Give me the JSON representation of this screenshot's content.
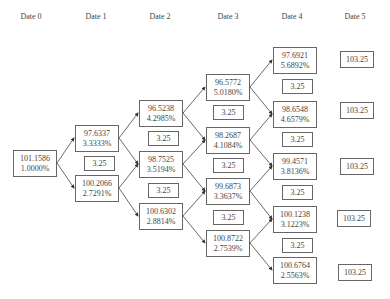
{
  "headers": [
    "Date 0",
    "Date 1",
    "Date 2",
    "Date 3",
    "Date 4",
    "Date 5"
  ],
  "coupon_label": "3.25",
  "nodes": {
    "d0": [
      {
        "price": "101.1586",
        "rate": "1.0000%"
      }
    ],
    "d1": [
      {
        "price": "97.6337",
        "rate": "3.3333%"
      },
      {
        "price": "100.2066",
        "rate": "2.7291%"
      }
    ],
    "d2": [
      {
        "price": "96.5238",
        "rate": "4.2985%"
      },
      {
        "price": "98.7525",
        "rate": "3.5194%"
      },
      {
        "price": "100.6302",
        "rate": "2.8814%"
      }
    ],
    "d3": [
      {
        "price": "96.5772",
        "rate": "5.0180%"
      },
      {
        "price": "98.2687",
        "rate": "4.1084%"
      },
      {
        "price": "99.6873",
        "rate": "3.3637%"
      },
      {
        "price": "100.8722",
        "rate": "2.7539%"
      }
    ],
    "d4": [
      {
        "price": "97.6921",
        "rate": "5.6892%"
      },
      {
        "price": "98.6548",
        "rate": "4.6579%"
      },
      {
        "price": "99.4571",
        "rate": "3.8136%"
      },
      {
        "price": "100.1238",
        "rate": "3.1223%"
      },
      {
        "price": "100.6764",
        "rate": "2.5563%"
      }
    ],
    "d5": [
      "103.25",
      "103.25",
      "103.25",
      "103.25",
      "103.25"
    ]
  },
  "coupons": {
    "d1": [
      "3.25"
    ],
    "d2": [
      "3.25",
      "3.25"
    ],
    "d3": [
      "3.25",
      "3.25",
      "3.25"
    ],
    "d4": [
      "3.25",
      "3.25",
      "3.25",
      "3.25"
    ]
  }
}
